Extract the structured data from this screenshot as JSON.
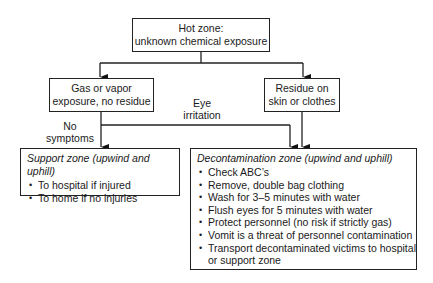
{
  "hot_zone": {
    "line1": "Hot zone:",
    "line2": "unknown chemical exposure"
  },
  "gas_box": {
    "line1": "Gas or vapor",
    "line2": "exposure, no residue"
  },
  "residue_box": {
    "line1": "Residue on",
    "line2": "skin or clothes"
  },
  "labels": {
    "no_symptoms_1": "No",
    "no_symptoms_2": "symptoms",
    "eye_1": "Eye",
    "eye_2": "irritation"
  },
  "support_zone": {
    "title": "Support zone (upwind and uphill)",
    "items": [
      "To hospital if injured",
      "To home if no injuries"
    ]
  },
  "decon_zone": {
    "title": "Decontamination zone (upwind and uphill)",
    "items": [
      "Check ABC’s",
      "Remove, double bag clothing",
      "Wash for 3–5 minutes with water",
      "Flush eyes for 5 minutes with water",
      "Protect personnel (no risk if strictly gas)",
      "Vomit is a threat of personnel contamination",
      "Transport decontaminated victims to hospital or support zone"
    ]
  }
}
